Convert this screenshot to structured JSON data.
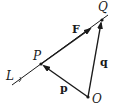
{
  "diagram": {
    "title": "",
    "stroke_color": "#1a1a1a",
    "background": "#ffffff",
    "points": {
      "P": {
        "label": "P",
        "x": 41,
        "y": 64
      },
      "Q": {
        "label": "Q",
        "x": 102,
        "y": 20
      },
      "O": {
        "label": "O",
        "x": 88,
        "y": 97
      }
    },
    "line": {
      "label": "L",
      "x1": 12,
      "y1": 85,
      "x2": 108,
      "y2": 15
    },
    "vectors": [
      {
        "name": "F",
        "label": "F",
        "from": "P",
        "to": "Q",
        "style": "bold"
      },
      {
        "name": "p",
        "label": "p",
        "from": "O",
        "to": "P",
        "style": "bold"
      },
      {
        "name": "q",
        "label": "q",
        "from": "O",
        "to": "Q",
        "style": "bold"
      }
    ],
    "labels": {
      "L": "L",
      "P": "P",
      "Q": "Q",
      "O": "O",
      "F": "F",
      "p": "p",
      "q": "q"
    }
  }
}
